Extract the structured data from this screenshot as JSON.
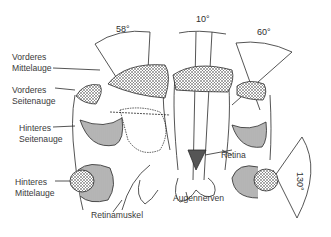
{
  "diagram": {
    "type": "anatomical-illustration",
    "labels": {
      "vorderes_mittelauge": [
        "Vorderes",
        "Mittelauge"
      ],
      "vorderes_seitenauge": [
        "Vorderes",
        "Seitenauge"
      ],
      "hinteres_seitenauge": [
        "Hinteres",
        "Seitenauge"
      ],
      "hinteres_mittelauge": [
        "Hinteres",
        "Mittelauge"
      ],
      "retinamuskel": "Retinamuskel",
      "augennerven": "Augennerven",
      "retina": "Retina"
    },
    "angles": {
      "vorderes_mittelauge": "58°",
      "center": "10°",
      "vorderes_seitenauge": "60°",
      "hinteres_mittelauge": "130°"
    },
    "colors": {
      "ink": "#2a2a2a",
      "text": "#3a3a3a",
      "background": "#ffffff"
    }
  }
}
